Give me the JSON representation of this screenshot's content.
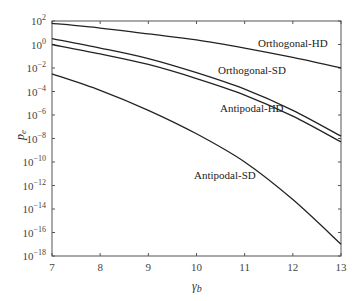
{
  "chart_data": {
    "type": "line",
    "title": "",
    "xlabel": "γb",
    "ylabel": "pe",
    "yscale": "log",
    "xlim": [
      7,
      13
    ],
    "ylim": [
      1e-18,
      100.0
    ],
    "grid": false,
    "legend": "inline curve labels",
    "x_ticks": [
      "7",
      "8",
      "9",
      "10",
      "11",
      "12",
      "13"
    ],
    "y_ticks": [
      "10^2",
      "10^0",
      "10^-2",
      "10^-4",
      "10^-6",
      "10^-8",
      "10^-10",
      "10^-12",
      "10^-14",
      "10^-16",
      "10^-18"
    ],
    "x": [
      7,
      8,
      9,
      10,
      11,
      12,
      13
    ],
    "series": [
      {
        "name": "Orthogonal-HD",
        "log10_values": [
          1.8,
          1.4,
          0.9,
          0.4,
          -0.3,
          -1.1,
          -2.0
        ]
      },
      {
        "name": "Orthogonal-SD",
        "log10_values": [
          0.5,
          -0.3,
          -1.2,
          -2.4,
          -3.8,
          -5.6,
          -7.8
        ]
      },
      {
        "name": "Antipodal-HD",
        "log10_values": [
          0.0,
          -0.8,
          -1.7,
          -2.9,
          -4.3,
          -6.1,
          -8.3
        ]
      },
      {
        "name": "Antipodal-SD",
        "log10_values": [
          -2.5,
          -3.9,
          -5.6,
          -7.6,
          -10.0,
          -13.2,
          -17.0
        ]
      }
    ]
  },
  "labels": {
    "xlabel_main": "γ",
    "xlabel_sub": "b",
    "ylabel_main": "p",
    "ylabel_sub": "e",
    "curves": [
      "Orthogonal-HD",
      "Orthogonal-SD",
      "Antipodal-HD",
      "Antipodal-SD"
    ]
  }
}
